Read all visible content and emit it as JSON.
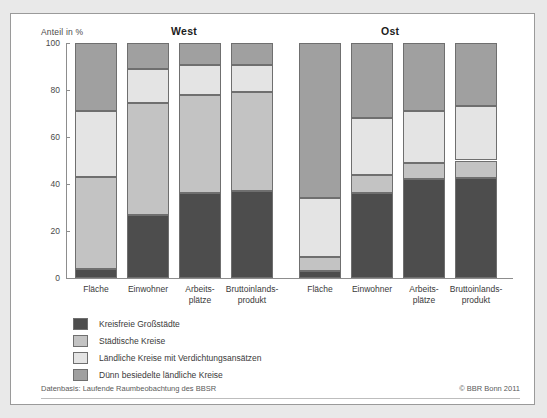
{
  "figure": {
    "y_axis_title": "Anteil in %",
    "footer_source": "Datenbasis: Laufende Raumbeobachtung des BBSR",
    "footer_copyright": "© BBR Bonn 2011"
  },
  "legend": {
    "items": [
      {
        "label": "Kreisfreie Großstädte",
        "color": "#4d4d4d",
        "key": "kreisfreie"
      },
      {
        "label": "Städtische Kreise",
        "color": "#c3c3c3",
        "key": "staedtische"
      },
      {
        "label": "Ländliche Kreise mit Verdichtungsansätzen",
        "color": "#e4e4e4",
        "key": "laendliche"
      },
      {
        "label": "Dünn besiedelte ländliche Kreise",
        "color": "#a0a0a0",
        "key": "duenn"
      }
    ]
  },
  "chart_data": {
    "type": "bar",
    "subtype": "stacked-100-percent",
    "title": "",
    "xlabel": "",
    "ylabel": "Anteil in %",
    "ylim": [
      0,
      100
    ],
    "yticks": [
      0,
      20,
      40,
      60,
      80,
      100
    ],
    "grid": false,
    "legend_position": "below-plot",
    "panels": [
      {
        "name": "West",
        "categories": [
          "Fläche",
          "Einwohner",
          "Arbeits-\nplätze",
          "Bruttoinlands-\nprodukt"
        ],
        "series": [
          {
            "name": "Kreisfreie Großstädte",
            "values": [
              4,
              27,
              36,
              37
            ]
          },
          {
            "name": "Städtische Kreise",
            "values": [
              39,
              47.5,
              42,
              42
            ]
          },
          {
            "name": "Ländliche Kreise mit Verdichtungsansätzen",
            "values": [
              28,
              14.5,
              12.5,
              11.5
            ]
          },
          {
            "name": "Dünn besiedelte ländliche Kreise",
            "values": [
              29,
              11,
              9.5,
              9.5
            ]
          }
        ]
      },
      {
        "name": "Ost",
        "categories": [
          "Fläche",
          "Einwohner",
          "Arbeits-\nplätze",
          "Bruttoinlands-\nprodukt"
        ],
        "series": [
          {
            "name": "Kreisfreie Großstädte",
            "values": [
              3,
              36,
              42,
              42.5
            ]
          },
          {
            "name": "Städtische Kreise",
            "values": [
              6,
              8,
              7,
              7.5
            ]
          },
          {
            "name": "Ländliche Kreise mit Verdichtungsansätzen",
            "values": [
              25,
              24,
              22,
              23
            ]
          },
          {
            "name": "Dünn besiedelte ländliche Kreise",
            "values": [
              66,
              32,
              29,
              27
            ]
          }
        ]
      }
    ]
  },
  "labels": {
    "panel_west": "West",
    "panel_ost": "Ost",
    "cat_flaeche": "Fläche",
    "cat_einwohner": "Einwohner",
    "cat_arbeitsplaetze_1": "Arbeits-",
    "cat_arbeitsplaetze_2": "plätze",
    "cat_bip_1": "Bruttoinlands-",
    "cat_bip_2": "produkt",
    "ytick_0": "0",
    "ytick_20": "20",
    "ytick_40": "40",
    "ytick_60": "60",
    "ytick_80": "80",
    "ytick_100": "100"
  }
}
